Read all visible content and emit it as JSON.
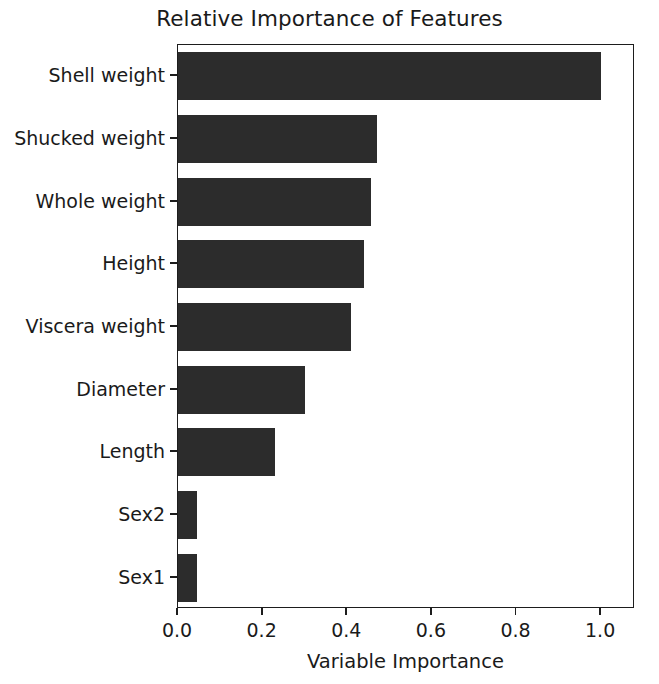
{
  "chart_data": {
    "type": "bar",
    "orientation": "horizontal",
    "title": "Relative Importance of Features",
    "xlabel": "Variable Importance",
    "ylabel": "",
    "categories": [
      "Shell weight",
      "Shucked weight",
      "Whole weight",
      "Height",
      "Viscera weight",
      "Diameter",
      "Length",
      "Sex2",
      "Sex1"
    ],
    "values": [
      1.0,
      0.47,
      0.455,
      0.44,
      0.41,
      0.3,
      0.23,
      0.045,
      0.045
    ],
    "xlim": [
      0.0,
      1.08
    ],
    "xticks": [
      0.0,
      0.2,
      0.4,
      0.6,
      0.8,
      1.0
    ],
    "xtick_labels": [
      "0.0",
      "0.2",
      "0.4",
      "0.6",
      "0.8",
      "1.0"
    ],
    "grid": false,
    "legend": false,
    "bar_color": "#2c2c2c",
    "axes_color": "#1d1d1d",
    "background": "#ffffff"
  }
}
